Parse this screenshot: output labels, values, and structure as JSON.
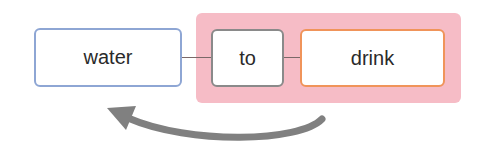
{
  "diagram": {
    "nodes": [
      {
        "id": "water",
        "label": "water",
        "border_color": "#8ea6d4"
      },
      {
        "id": "to",
        "label": "to",
        "border_color": "#8a8a8a"
      },
      {
        "id": "drink",
        "label": "drink",
        "border_color": "#f0945a"
      }
    ],
    "edges": [
      {
        "from": "water",
        "to": "to"
      },
      {
        "from": "to",
        "to": "drink"
      }
    ],
    "group": {
      "members": [
        "to",
        "drink"
      ],
      "fill_color": "#f6bcc6"
    },
    "arrow": {
      "from": "group",
      "to": "water",
      "direction": "right-to-left",
      "color": "#808080"
    }
  }
}
